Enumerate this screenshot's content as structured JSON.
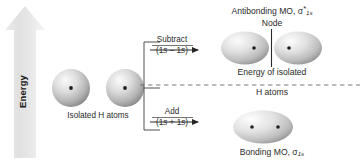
{
  "diagram": {
    "axis": {
      "label": "Energy",
      "direction": "up",
      "arrow_color": "#e3e3e3"
    },
    "reactants": {
      "caption": "Isolated H atoms",
      "orbital_count": 2,
      "orbital_type": "1s atomic orbital",
      "nucleus_symbol": "•"
    },
    "operations": [
      {
        "name": "subtract",
        "label": "Subtract",
        "expression": "(1s – 1s)",
        "expr_open": "(1",
        "expr_italic_1": "s",
        "expr_operator": " – 1",
        "expr_italic_2": "s",
        "expr_close": ")"
      },
      {
        "name": "add",
        "label": "Add",
        "expression": "(1s + 1s)",
        "expr_open": "(1",
        "expr_italic_1": "s",
        "expr_operator": " + 1",
        "expr_italic_2": "s",
        "expr_close": ")"
      }
    ],
    "products": {
      "antibonding": {
        "label_text": "Antibonding MO, ",
        "symbol": "σ",
        "superscript": "*",
        "subscript": "1s",
        "node_label": "Node",
        "lobes": 2,
        "nuclei": 2
      },
      "bonding": {
        "label_text": "Bonding MO, ",
        "symbol": "σ",
        "superscript": "",
        "subscript": "1s",
        "lobes": 1,
        "nuclei": 2
      }
    },
    "reference_line": {
      "line_1": "Energy of isolated",
      "line_2": "H atoms",
      "style": "dashed"
    },
    "colors": {
      "text": "#2b2b2b",
      "line": "#3c3c3c",
      "orbital_fill_light": "#f2f2f2",
      "orbital_fill_mid": "#cdcdcd",
      "orbital_fill_dark": "#9a9a9a",
      "background": "#ffffff",
      "arrow_axis": "#e3e3e3"
    }
  }
}
